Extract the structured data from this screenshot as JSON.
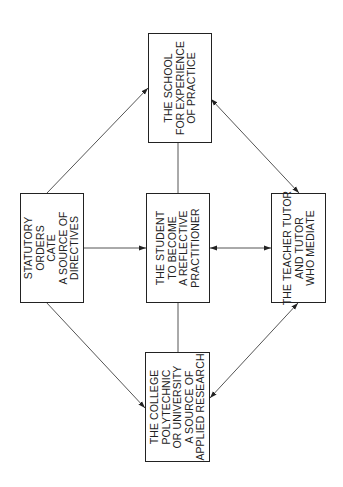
{
  "diagram": {
    "nodes": {
      "school": {
        "label": "THE SCHOOL\nFOR EXPERIENCE\nOF PRACTICE"
      },
      "statutory": {
        "label": "STATUTORY\nORDERS\nCATE\nA SOURCE OF\nDIRECTIVES"
      },
      "student": {
        "label": "THE STUDENT\nTO BECOME\nA REFLECTIVE\nPRACTITIONER"
      },
      "teacher": {
        "label": "THE TEACHER TUTOR\nAND TUTOR\nWHO MEDIATE"
      },
      "college": {
        "label": "THE COLLEGE\nPOLYTECHNIC\nOR UNIVERSITY\nA SOURCE OF\nAPPLIED RESEARCH"
      }
    },
    "edges": [
      {
        "from": "statutory",
        "to": "school",
        "direction": "forward"
      },
      {
        "from": "statutory",
        "to": "student",
        "direction": "forward"
      },
      {
        "from": "statutory",
        "to": "college",
        "direction": "forward"
      },
      {
        "from": "school",
        "to": "teacher",
        "direction": "both"
      },
      {
        "from": "student",
        "to": "teacher",
        "direction": "both"
      },
      {
        "from": "teacher",
        "to": "college",
        "direction": "both"
      },
      {
        "from": "school",
        "to": "student",
        "direction": "none"
      },
      {
        "from": "student",
        "to": "college",
        "direction": "none"
      }
    ],
    "colors": {
      "line": "#555555",
      "border": "#222222",
      "text": "#222222",
      "background": "#ffffff"
    }
  }
}
